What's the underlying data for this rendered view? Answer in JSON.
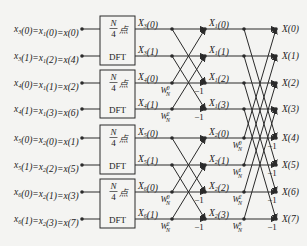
{
  "diagram": {
    "rows_y": [
      29,
      56,
      83,
      109,
      138,
      165,
      192,
      219
    ],
    "inputs": [
      {
        "label": "x3(0)=x1(0)=x(0)"
      },
      {
        "label": "x3(1)=x1(2)=x(4)"
      },
      {
        "label": "x4(0)=x1(1)=x(2)"
      },
      {
        "label": "x4(1)=x1(3)=x(6)"
      },
      {
        "label": "x5(0)=x2(0)=x(1)"
      },
      {
        "label": "x5(1)=x2(2)=x(5)"
      },
      {
        "label": "x6(0)=x2(1)=x(3)"
      },
      {
        "label": "x6(1)=x2(3)=x(7)"
      }
    ],
    "dft_blocks": [
      {
        "top": "N",
        "bottom": "4",
        "suffix": "点",
        "name": "DFT"
      },
      {
        "top": "N",
        "bottom": "4",
        "suffix": "点",
        "name": "DFT"
      },
      {
        "top": "N",
        "bottom": "4",
        "suffix": "点",
        "name": "DFT"
      },
      {
        "top": "N",
        "bottom": "4",
        "suffix": "点",
        "name": "DFT"
      }
    ],
    "dft_outputs": [
      "X3(0)",
      "X3(1)",
      "X4(0)",
      "X4(1)",
      "X5(0)",
      "X5(1)",
      "X6(0)",
      "X6(1)"
    ],
    "stage1_outputs": [
      "X1(0)",
      "X1(1)",
      "X1(2)",
      "X1(3)",
      "X2(0)",
      "X2(1)",
      "X2(2)",
      "X2(3)"
    ],
    "outputs": [
      "X(0)",
      "X(1)",
      "X(2)",
      "X(3)",
      "X(4)",
      "X(5)",
      "X(6)",
      "X(7)"
    ],
    "stage1_twiddles": [
      {
        "row": 2,
        "base": "W",
        "sub": "N",
        "sup": "0"
      },
      {
        "row": 3,
        "base": "W",
        "sub": "N",
        "sup": "2"
      },
      {
        "row": 6,
        "base": "W",
        "sub": "N",
        "sup": "0"
      },
      {
        "row": 7,
        "base": "W",
        "sub": "N",
        "sup": "2"
      }
    ],
    "stage2_twiddles": [
      {
        "row": 4,
        "base": "W",
        "sub": "N",
        "sup": "0"
      },
      {
        "row": 5,
        "base": "W",
        "sub": "N",
        "sup": "1"
      },
      {
        "row": 6,
        "base": "W",
        "sub": "N",
        "sup": "2"
      },
      {
        "row": 7,
        "base": "W",
        "sub": "N",
        "sup": "3"
      }
    ],
    "minus_one": "−1",
    "colors": {
      "background": "#f4f4f2",
      "stroke": "#2a2a2a",
      "text": "#222222"
    }
  }
}
